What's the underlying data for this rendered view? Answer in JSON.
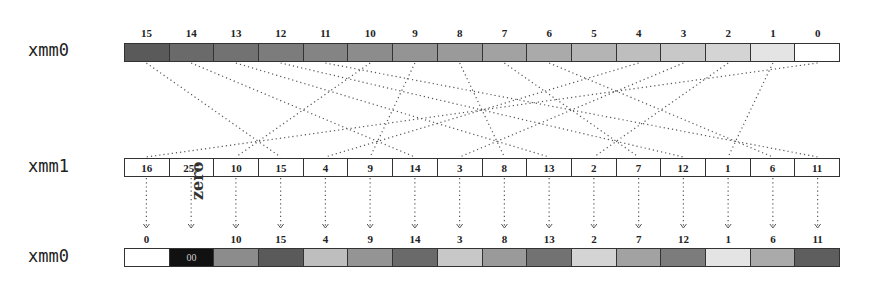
{
  "registers": {
    "src_label": "xmm0",
    "mask_label": "xmm1",
    "dst_label": "xmm0"
  },
  "src": {
    "indices": [
      "15",
      "14",
      "13",
      "12",
      "11",
      "10",
      "9",
      "8",
      "7",
      "6",
      "5",
      "4",
      "3",
      "2",
      "1",
      "0"
    ],
    "colors": [
      "#5a5a5a",
      "#6a6a6a",
      "#727272",
      "#7c7c7c",
      "#848484",
      "#8c8c8c",
      "#949494",
      "#9a9a9a",
      "#a2a2a2",
      "#aaaaaa",
      "#b4b4b4",
      "#bebebe",
      "#c8c8c8",
      "#d4d4d4",
      "#e4e4e4",
      "#ffffff"
    ]
  },
  "mask": {
    "values": [
      "16",
      "255",
      "10",
      "15",
      "4",
      "9",
      "14",
      "3",
      "8",
      "13",
      "2",
      "7",
      "12",
      "1",
      "6",
      "11"
    ]
  },
  "dst": {
    "labels": [
      "0",
      "",
      "10",
      "15",
      "4",
      "9",
      "14",
      "3",
      "8",
      "13",
      "2",
      "7",
      "12",
      "1",
      "6",
      "11"
    ],
    "cell_text": [
      "",
      "00",
      "",
      "",
      "",
      "",
      "",
      "",
      "",
      "",
      "",
      "",
      "",
      "",
      "",
      ""
    ],
    "colors": [
      "#ffffff",
      "#111111",
      "#8c8c8c",
      "#5a5a5a",
      "#bebebe",
      "#949494",
      "#6a6a6a",
      "#c8c8c8",
      "#9a9a9a",
      "#727272",
      "#d4d4d4",
      "#a2a2a2",
      "#7c7c7c",
      "#e4e4e4",
      "#aaaaaa",
      "#5e5e5e"
    ],
    "zero_label": "zero"
  }
}
